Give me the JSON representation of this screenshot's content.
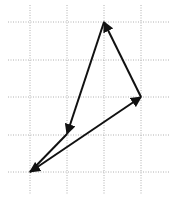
{
  "diagram": {
    "type": "vector-diagram-on-grid",
    "background": "#ffffff",
    "grid": {
      "color": "#b0b0b0",
      "style": "dotted",
      "vertical_x": [
        30,
        67,
        104,
        141
      ],
      "horizontal_y": [
        22,
        60,
        97,
        135,
        172
      ],
      "x_extent": [
        8,
        170
      ],
      "y_extent": [
        5,
        195
      ]
    },
    "points": {
      "A": [
        104,
        22
      ],
      "B": [
        141,
        97
      ],
      "C": [
        30,
        172
      ],
      "D": [
        67,
        134
      ]
    },
    "arrows": [
      {
        "id": "b-to-a",
        "from": "B",
        "to": "A",
        "head_end": true,
        "head_start": false
      },
      {
        "id": "a-to-d",
        "from": "A",
        "to": "D",
        "head_end": true,
        "head_start": false
      },
      {
        "id": "d-to-c",
        "from": "D",
        "to": "C",
        "head_end": false,
        "head_start": false
      },
      {
        "id": "c-b",
        "from": "C",
        "to": "B",
        "head_end": true,
        "head_start": true
      }
    ],
    "stroke_color": "#111111"
  }
}
